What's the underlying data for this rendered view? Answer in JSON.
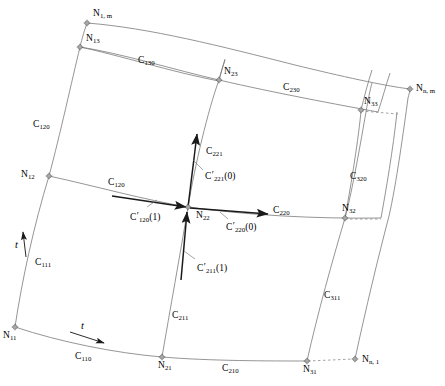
{
  "figure": {
    "type": "curvilinear-mesh-diagram",
    "width": 445,
    "height": 386,
    "background": "#ffffff",
    "curve_color": "#7a7a7a",
    "vector_color": "#1a1a1a",
    "label_color": "#000000"
  },
  "nodes": [
    {
      "id": "N1m",
      "base": "N",
      "sub": "1, m",
      "x": 87,
      "y": 23,
      "label_dx": 6,
      "label_dy": -14
    },
    {
      "id": "N13",
      "base": "N",
      "sub": "13",
      "x": 80,
      "y": 47,
      "label_dx": 6,
      "label_dy": -13
    },
    {
      "id": "N23",
      "base": "N",
      "sub": "23",
      "x": 219,
      "y": 80,
      "label_dx": 5,
      "label_dy": -13
    },
    {
      "id": "N33",
      "base": "N",
      "sub": "33",
      "x": 361,
      "y": 110,
      "label_dx": 3,
      "label_dy": -13
    },
    {
      "id": "Nnm",
      "base": "N",
      "sub": "n, m",
      "x": 410,
      "y": 89,
      "label_dx": 6,
      "label_dy": -5
    },
    {
      "id": "N12",
      "base": "N",
      "sub": "12",
      "x": 49,
      "y": 176,
      "label_dx": -28,
      "label_dy": -6
    },
    {
      "id": "N22",
      "base": "N",
      "sub": "22",
      "x": 188,
      "y": 207,
      "label_dx": 8,
      "label_dy": 4
    },
    {
      "id": "N32",
      "base": "N",
      "sub": "32",
      "x": 345,
      "y": 218,
      "label_dx": -3,
      "label_dy": -14
    },
    {
      "id": "N11",
      "base": "N",
      "sub": "11",
      "x": 15,
      "y": 327,
      "label_dx": -12,
      "label_dy": 4
    },
    {
      "id": "N21",
      "base": "N",
      "sub": "21",
      "x": 162,
      "y": 357,
      "label_dx": -4,
      "label_dy": 4
    },
    {
      "id": "N31",
      "base": "N",
      "sub": "31",
      "x": 307,
      "y": 361,
      "label_dx": -4,
      "label_dy": 4
    },
    {
      "id": "Nn1",
      "base": "N",
      "sub": "n, 1",
      "x": 355,
      "y": 359,
      "label_dx": 7,
      "label_dy": -4
    }
  ],
  "curve_labels": [
    {
      "id": "C130",
      "base": "C",
      "sub": "130",
      "x": 138,
      "y": 56
    },
    {
      "id": "C230",
      "base": "C",
      "sub": "230",
      "x": 283,
      "y": 83
    },
    {
      "id": "C120v",
      "base": "C",
      "sub": "120",
      "x": 33,
      "y": 120
    },
    {
      "id": "C120h",
      "base": "C",
      "sub": "120",
      "x": 108,
      "y": 178
    },
    {
      "id": "C221",
      "base": "C",
      "sub": "221",
      "x": 206,
      "y": 147
    },
    {
      "id": "C220",
      "base": "C",
      "sub": "220",
      "x": 273,
      "y": 206
    },
    {
      "id": "C320",
      "base": "C",
      "sub": "320",
      "x": 350,
      "y": 172
    },
    {
      "id": "C111",
      "base": "C",
      "sub": "111",
      "x": 35,
      "y": 258
    },
    {
      "id": "C211",
      "base": "C",
      "sub": "211",
      "x": 172,
      "y": 311
    },
    {
      "id": "C311",
      "base": "C",
      "sub": "311",
      "x": 324,
      "y": 291
    },
    {
      "id": "C110",
      "base": "C",
      "sub": "110",
      "x": 75,
      "y": 352
    },
    {
      "id": "C210",
      "base": "C",
      "sub": "210",
      "x": 222,
      "y": 364
    }
  ],
  "derivative_labels": [
    {
      "id": "Cp221",
      "base": "C",
      "prime": "′",
      "sub": "221",
      "arg": "(0)",
      "x": 205,
      "y": 172
    },
    {
      "id": "Cp120",
      "base": "C",
      "prime": "′",
      "sub": "120",
      "arg": "(1)",
      "x": 130,
      "y": 213
    },
    {
      "id": "Cp220",
      "base": "C",
      "prime": "′",
      "sub": "220",
      "arg": "(0)",
      "x": 226,
      "y": 223
    },
    {
      "id": "Cp211",
      "base": "C",
      "prime": "′",
      "sub": "211",
      "arg": "(1)",
      "x": 197,
      "y": 264
    }
  ],
  "parameter_arrows": [
    {
      "id": "t-vertical",
      "label": "t",
      "x": 15,
      "y": 239
    },
    {
      "id": "t-horizontal",
      "label": "t",
      "x": 81,
      "y": 320
    }
  ]
}
